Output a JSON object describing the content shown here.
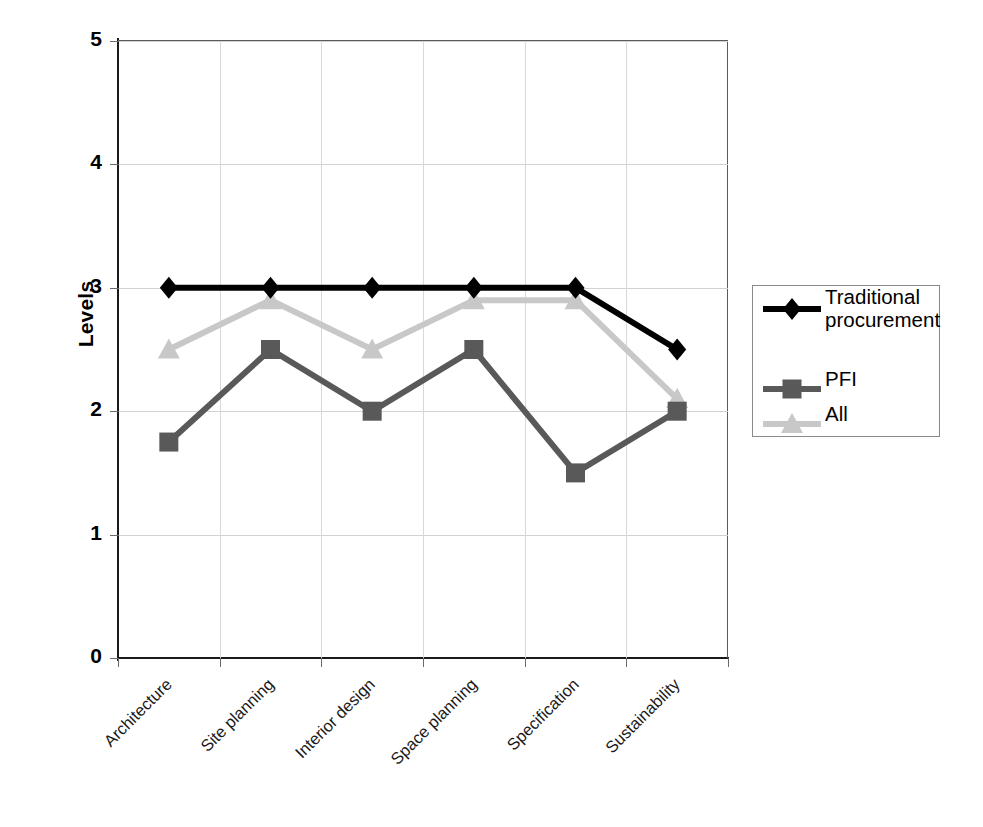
{
  "chart_data": {
    "type": "line",
    "title": "",
    "xlabel": "",
    "ylabel": "Levels",
    "ylim": [
      0,
      5
    ],
    "yticks": [
      0,
      1,
      2,
      3,
      4,
      5
    ],
    "grid": true,
    "legend_position": "right",
    "categories": [
      "Architecture",
      "Site planning",
      "Interior design",
      "Space planning",
      "Specification",
      "Sustainability"
    ],
    "series": [
      {
        "name": "Traditional procurement",
        "marker": "diamond",
        "color": "#000000",
        "values": [
          3.0,
          3.0,
          3.0,
          3.0,
          3.0,
          2.5
        ]
      },
      {
        "name": "PFI",
        "marker": "square",
        "color": "#595959",
        "values": [
          1.75,
          2.5,
          2.0,
          2.5,
          1.5,
          2.0
        ]
      },
      {
        "name": "All",
        "marker": "triangle",
        "color": "#c8c8c8",
        "values": [
          2.5,
          2.9,
          2.5,
          2.9,
          2.9,
          2.1
        ]
      }
    ]
  },
  "axis": {
    "y_title": "Levels",
    "y_tick_labels": [
      "0",
      "1",
      "2",
      "3",
      "4",
      "5"
    ],
    "x_tick_labels": [
      "Architecture",
      "Site planning",
      "Interior design",
      "Space planning",
      "Specification",
      "Sustainability"
    ]
  },
  "legend": {
    "items": [
      {
        "label": "Traditional procurement",
        "color": "#000000",
        "marker": "diamond-marker-icon"
      },
      {
        "label": "PFI",
        "color": "#595959",
        "marker": "square-marker-icon"
      },
      {
        "label": "All",
        "color": "#c8c8c8",
        "marker": "triangle-marker-icon"
      }
    ]
  }
}
